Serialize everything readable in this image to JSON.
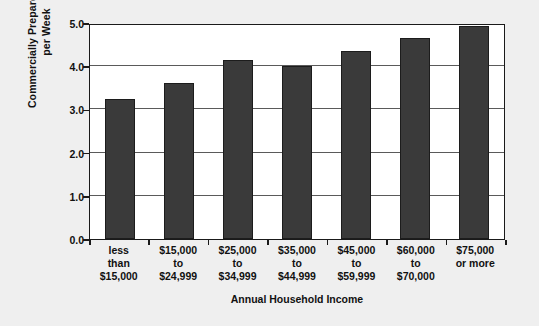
{
  "chart_data": {
    "type": "bar",
    "title": "",
    "xlabel": "Annual Household Income",
    "ylabel": "Commercially Prepared Meals per Week",
    "ylabel_lines": [
      "Commercially Prepared Meals",
      "per Week"
    ],
    "categories": [
      "less than $15,000",
      "$15,000 to $24,999",
      "$25,000 to $34,999",
      "$35,000 to $44,999",
      "$45,000 to $59,999",
      "$60,000 to $70,000",
      "$75,000 or more"
    ],
    "category_lines": [
      [
        "less",
        "than",
        "$15,000"
      ],
      [
        "$15,000",
        "to",
        "$24,999"
      ],
      [
        "$25,000",
        "to",
        "$34,999"
      ],
      [
        "$35,000",
        "to",
        "$44,999"
      ],
      [
        "$45,000",
        "to",
        "$59,999"
      ],
      [
        "$60,000",
        "to",
        "$70,000"
      ],
      [
        "$75,000",
        "or more"
      ]
    ],
    "values": [
      3.25,
      3.6,
      4.15,
      4.0,
      4.35,
      4.65,
      4.93
    ],
    "ylim": [
      0.0,
      5.0
    ],
    "ytick_labels": [
      "0.0",
      "1.0",
      "2.0",
      "3.0",
      "4.0",
      "5.0"
    ],
    "ytick_values": [
      0.0,
      1.0,
      2.0,
      3.0,
      4.0,
      5.0
    ],
    "grid": true,
    "legend": "none",
    "bar_color": "#3a3a3a",
    "plot_background": "#ffffff",
    "figure_background": "#efefef",
    "axis_color": "#1a1a1a"
  }
}
